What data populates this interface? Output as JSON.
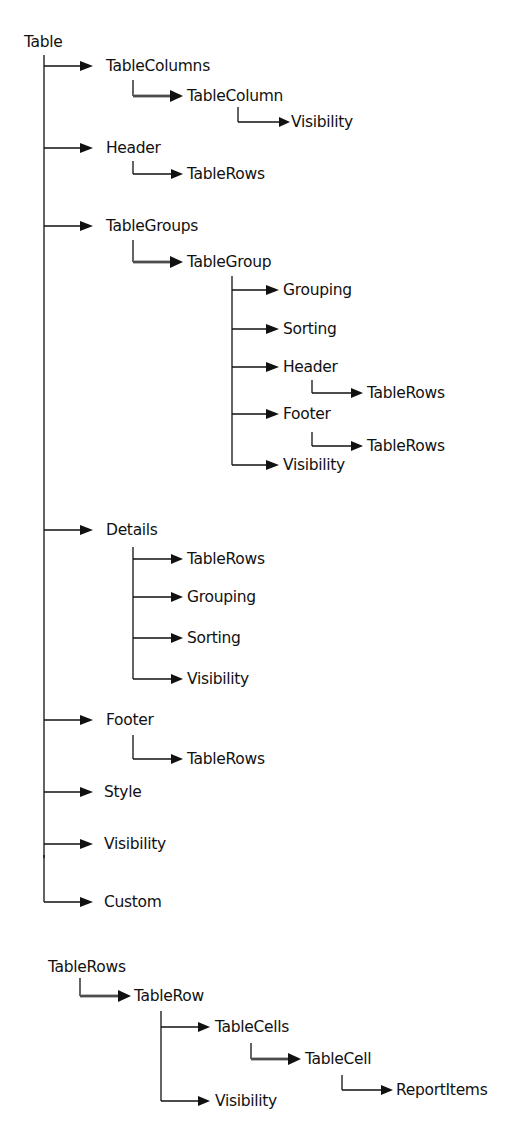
{
  "diagram": {
    "type": "hierarchy",
    "trees": [
      {
        "root": "Table",
        "children": [
          {
            "label": "TableColumns",
            "children": [
              {
                "label": "TableColumn",
                "collection": true,
                "children": [
                  {
                    "label": "Visibility"
                  }
                ]
              }
            ]
          },
          {
            "label": "Header",
            "children": [
              {
                "label": "TableRows"
              }
            ]
          },
          {
            "label": "TableGroups",
            "children": [
              {
                "label": "TableGroup",
                "collection": true,
                "children": [
                  {
                    "label": "Grouping"
                  },
                  {
                    "label": "Sorting"
                  },
                  {
                    "label": "Header",
                    "children": [
                      {
                        "label": "TableRows"
                      }
                    ]
                  },
                  {
                    "label": "Footer",
                    "children": [
                      {
                        "label": "TableRows"
                      }
                    ]
                  },
                  {
                    "label": "Visibility"
                  }
                ]
              }
            ]
          },
          {
            "label": "Details",
            "children": [
              {
                "label": "TableRows"
              },
              {
                "label": "Grouping"
              },
              {
                "label": "Sorting"
              },
              {
                "label": "Visibility"
              }
            ]
          },
          {
            "label": "Footer",
            "children": [
              {
                "label": "TableRows"
              }
            ]
          },
          {
            "label": "Style"
          },
          {
            "label": "Visibility"
          },
          {
            "label": "Custom"
          }
        ]
      },
      {
        "root": "TableRows",
        "children": [
          {
            "label": "TableRow",
            "collection": true,
            "children": [
              {
                "label": "TableCells",
                "children": [
                  {
                    "label": "TableCell",
                    "collection": true,
                    "children": [
                      {
                        "label": "ReportItems"
                      }
                    ]
                  }
                ]
              },
              {
                "label": "Visibility"
              }
            ]
          }
        ]
      }
    ]
  },
  "labels": {
    "table": "Table",
    "tablecolumns": "TableColumns",
    "tablecolumn": "TableColumn",
    "tablecolumn_visibility": "Visibility",
    "header": "Header",
    "header_tablerows": "TableRows",
    "tablegroups": "TableGroups",
    "tablegroup": "TableGroup",
    "group_grouping": "Grouping",
    "group_sorting": "Sorting",
    "group_header": "Header",
    "group_header_tablerows": "TableRows",
    "group_footer": "Footer",
    "group_footer_tablerows": "TableRows",
    "group_visibility": "Visibility",
    "details": "Details",
    "details_tablerows": "TableRows",
    "details_grouping": "Grouping",
    "details_sorting": "Sorting",
    "details_visibility": "Visibility",
    "footer": "Footer",
    "footer_tablerows": "TableRows",
    "style": "Style",
    "visibility": "Visibility",
    "custom": "Custom",
    "tablerows_root": "TableRows",
    "tablerow": "TableRow",
    "tablecells": "TableCells",
    "tablecell": "TableCell",
    "reportitems": "ReportItems",
    "tablerow_visibility": "Visibility"
  }
}
